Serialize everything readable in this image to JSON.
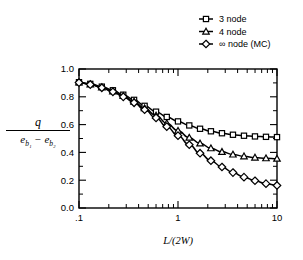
{
  "chart_data": {
    "type": "line",
    "title": "",
    "xlabel": "L/(2W)",
    "ylabel_numerator": "q",
    "ylabel_denominator": "e_b1 - e_b2",
    "xscale": "log",
    "xlim": [
      0.1,
      10
    ],
    "ylim": [
      0.0,
      1.0
    ],
    "grid": false,
    "legend_position": "top-right",
    "xticks": [
      ".1",
      "1",
      "10"
    ],
    "xtick_values": [
      0.1,
      1,
      10
    ],
    "yticks": [
      "0.0",
      "0.2",
      "0.4",
      "0.6",
      "0.8",
      "1.0"
    ],
    "ytick_values": [
      0.0,
      0.2,
      0.4,
      0.6,
      0.8,
      1.0
    ],
    "series": [
      {
        "name": "3 node",
        "marker": "square",
        "x": [
          0.1,
          0.13,
          0.17,
          0.22,
          0.28,
          0.36,
          0.46,
          0.6,
          0.77,
          1.0,
          1.3,
          1.67,
          2.15,
          2.78,
          3.59,
          4.64,
          5.99,
          7.74,
          10.0
        ],
        "y": [
          0.905,
          0.893,
          0.873,
          0.847,
          0.815,
          0.778,
          0.735,
          0.693,
          0.655,
          0.623,
          0.594,
          0.57,
          0.552,
          0.538,
          0.527,
          0.52,
          0.515,
          0.512,
          0.51
        ]
      },
      {
        "name": "4 node",
        "marker": "triangle",
        "x": [
          0.1,
          0.13,
          0.17,
          0.22,
          0.28,
          0.36,
          0.46,
          0.6,
          0.77,
          1.0,
          1.3,
          1.67,
          2.15,
          2.78,
          3.59,
          4.64,
          5.99,
          7.74,
          10.0
        ],
        "y": [
          0.903,
          0.89,
          0.868,
          0.84,
          0.806,
          0.765,
          0.718,
          0.665,
          0.61,
          0.556,
          0.506,
          0.465,
          0.43,
          0.404,
          0.385,
          0.372,
          0.363,
          0.358,
          0.355
        ]
      },
      {
        "name": "∞ node (MC)",
        "marker": "diamond",
        "x": [
          0.1,
          0.13,
          0.17,
          0.22,
          0.28,
          0.36,
          0.46,
          0.6,
          0.77,
          1.0,
          1.3,
          1.67,
          2.15,
          2.78,
          3.59,
          4.64,
          5.99,
          7.74,
          10.0
        ],
        "y": [
          0.902,
          0.888,
          0.865,
          0.836,
          0.8,
          0.757,
          0.707,
          0.648,
          0.585,
          0.52,
          0.455,
          0.394,
          0.34,
          0.295,
          0.255,
          0.222,
          0.196,
          0.175,
          0.162
        ]
      }
    ]
  },
  "legend": {
    "items": [
      {
        "label": "3 node",
        "marker": "square"
      },
      {
        "label": "4 node",
        "marker": "triangle"
      },
      {
        "label": "∞ node (MC)",
        "marker": "diamond"
      }
    ]
  },
  "axes": {
    "x_label": "L/(2W)",
    "y_numerator": "q",
    "y_denominator_a": "e",
    "y_denominator_a_sub": "b₁",
    "y_denominator_minus": "−",
    "y_denominator_b": "e",
    "y_denominator_b_sub": "b₂"
  }
}
